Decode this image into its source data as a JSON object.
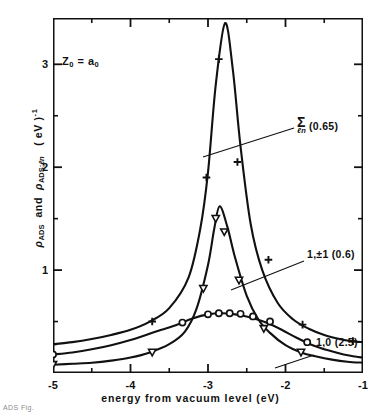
{
  "figure": {
    "annotation": "Z₀ = a₀",
    "caption_fragment": "ADS  Fig."
  },
  "chart_data": {
    "type": "line",
    "title": "",
    "subtitle": "",
    "xlabel": "energy  from  vacuum  level (eV)",
    "ylabel": "ρ_ADS  and  ρ_ADS;ℓn   (eV)⁻¹",
    "xlim": [
      -5,
      -1
    ],
    "ylim": [
      0,
      3.45
    ],
    "xticks": [
      -5,
      -4,
      -3,
      -2,
      -1
    ],
    "xticklabels": [
      "-5",
      "-4",
      "-3",
      "-2",
      "-1"
    ],
    "yticks": [
      1,
      2,
      3
    ],
    "yticklabels": [
      "1",
      "2",
      "3"
    ],
    "yminorticks": [
      0.5,
      1.5,
      2.5,
      3.5
    ],
    "xminorticks": [
      -4.5,
      -3.5,
      -2.5,
      -1.5
    ],
    "grid": false,
    "legend_position": "in-plot callouts, right side",
    "annotations": [
      {
        "text": "Z₀ = a₀",
        "x": -4.7,
        "y": 2.85
      }
    ],
    "series": [
      {
        "name": "Σ_ℓn (0.65)",
        "label": "Σ",
        "label_sub": "ℓn",
        "label_paren": "(0.65)",
        "marker": "plus",
        "peak_x": -2.78,
        "peak_y": 3.4,
        "width": 0.65,
        "x": [
          -5.0,
          -4.75,
          -4.5,
          -4.25,
          -4.0,
          -3.75,
          -3.5,
          -3.25,
          -3.1,
          -3.0,
          -2.9,
          -2.78,
          -2.68,
          -2.58,
          -2.45,
          -2.3,
          -2.1,
          -1.9,
          -1.7,
          -1.5,
          -1.3,
          -1.15,
          -1.0
        ],
        "y": [
          0.28,
          0.3,
          0.33,
          0.37,
          0.42,
          0.5,
          0.63,
          0.93,
          1.4,
          1.95,
          2.8,
          3.4,
          2.95,
          2.2,
          1.45,
          1.0,
          0.68,
          0.52,
          0.43,
          0.37,
          0.33,
          0.31,
          0.3
        ],
        "marker_x": [
          -5.0,
          -3.72,
          -3.02,
          -2.86,
          -2.62,
          -2.22,
          -1.78,
          -1.13
        ],
        "marker_y": [
          0.28,
          0.5,
          1.9,
          3.05,
          2.05,
          1.1,
          0.47,
          0.31
        ]
      },
      {
        "name": "1,±1 (0.6)",
        "label": "1,±1",
        "label_paren": "(0.6)",
        "marker": "triangle-down",
        "peak_x": -2.85,
        "peak_y": 1.62,
        "width": 0.6,
        "x": [
          -5.0,
          -4.75,
          -4.5,
          -4.25,
          -4.0,
          -3.75,
          -3.5,
          -3.3,
          -3.15,
          -3.0,
          -2.92,
          -2.85,
          -2.75,
          -2.65,
          -2.5,
          -2.35,
          -2.2,
          -2.0,
          -1.8,
          -1.6,
          -1.4,
          -1.2,
          -1.0
        ],
        "y": [
          0.08,
          0.09,
          0.1,
          0.12,
          0.15,
          0.2,
          0.28,
          0.4,
          0.62,
          1.05,
          1.4,
          1.62,
          1.42,
          1.12,
          0.75,
          0.52,
          0.39,
          0.27,
          0.2,
          0.16,
          0.13,
          0.11,
          0.1
        ],
        "marker_x": [
          -5.0,
          -3.72,
          -3.06,
          -2.9,
          -2.79,
          -2.6,
          -2.28,
          -1.8
        ],
        "marker_y": [
          0.08,
          0.2,
          0.82,
          1.5,
          1.37,
          0.9,
          0.43,
          0.2
        ]
      },
      {
        "name": "1,0 (2.5)",
        "label": "1,0",
        "label_paren": "(2.5)",
        "marker": "circle",
        "peak_x": -2.82,
        "peak_y": 0.58,
        "width": 2.5,
        "x": [
          -5.0,
          -4.75,
          -4.5,
          -4.25,
          -4.0,
          -3.8,
          -3.6,
          -3.4,
          -3.2,
          -3.0,
          -2.82,
          -2.65,
          -2.45,
          -2.25,
          -2.05,
          -1.85,
          -1.65,
          -1.45,
          -1.25,
          -1.1,
          -1.0
        ],
        "y": [
          0.18,
          0.2,
          0.23,
          0.27,
          0.32,
          0.37,
          0.42,
          0.47,
          0.53,
          0.57,
          0.58,
          0.57,
          0.54,
          0.49,
          0.42,
          0.34,
          0.27,
          0.22,
          0.18,
          0.16,
          0.15
        ],
        "marker_x": [
          -5.0,
          -3.33,
          -3.0,
          -2.86,
          -2.72,
          -2.58,
          -2.42,
          -2.2,
          -1.72
        ],
        "marker_y": [
          0.18,
          0.49,
          0.57,
          0.58,
          0.58,
          0.575,
          0.55,
          0.5,
          0.3
        ]
      }
    ]
  }
}
